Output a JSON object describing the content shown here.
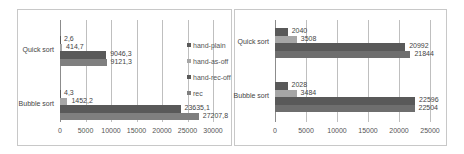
{
  "colors": {
    "hand-plain": "#595959",
    "hand-as-off": "#a6a6a6",
    "hand-rec-off": "#595959",
    "rec": "#7f7f7f"
  },
  "chart_data": [
    {
      "type": "bar",
      "orientation": "horizontal",
      "title": "",
      "categories": [
        "Quick sort",
        "Bubble sort"
      ],
      "series": [
        {
          "name": "hand-plain",
          "values": [
            2.6,
            4.3
          ],
          "labels": [
            "2,6",
            "4,3"
          ]
        },
        {
          "name": "hand-as-off",
          "values": [
            414.7,
            1452.2
          ],
          "labels": [
            "414,7",
            "1452,2"
          ]
        },
        {
          "name": "hand-rec-off",
          "values": [
            9046.3,
            23635.1
          ],
          "labels": [
            "9046,3",
            "23635,1"
          ]
        },
        {
          "name": "rec",
          "values": [
            9121.3,
            27207.8
          ],
          "labels": [
            "9121,3",
            "27207,8"
          ]
        }
      ],
      "xlim": [
        0,
        30000
      ],
      "xticks": [
        "0",
        "5000",
        "10000",
        "15000",
        "20000",
        "25000",
        "30000"
      ],
      "legend": [
        "hand-plain",
        "hand-as-off",
        "hand-rec-off",
        "rec"
      ],
      "legend_position": "right",
      "grid": true
    },
    {
      "type": "bar",
      "orientation": "horizontal",
      "title": "",
      "categories": [
        "Quick sort",
        "Bubble sort"
      ],
      "series": [
        {
          "name": "series1",
          "values": [
            2040,
            2028
          ],
          "labels": [
            "2040",
            "2028"
          ]
        },
        {
          "name": "series2",
          "values": [
            3508,
            3484
          ],
          "labels": [
            "3508",
            "3484"
          ]
        },
        {
          "name": "series3",
          "values": [
            20992,
            22596
          ],
          "labels": [
            "20992",
            "22596"
          ]
        },
        {
          "name": "series4",
          "values": [
            21844,
            22504
          ],
          "labels": [
            "21844",
            "22504"
          ]
        }
      ],
      "xlim": [
        0,
        25000
      ],
      "xticks": [
        "0",
        "5000",
        "10000",
        "15000",
        "20000",
        "25000"
      ],
      "legend": [],
      "grid": true
    }
  ]
}
